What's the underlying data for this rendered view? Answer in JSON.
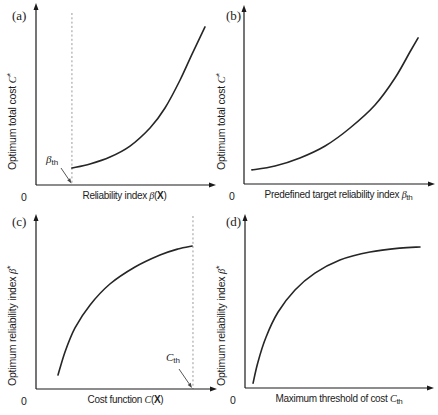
{
  "figure": {
    "colors": {
      "background": "#ffffff",
      "axis": "#1a1a1a",
      "curve": "#262626",
      "dashed": "#9a9a9a",
      "text": "#1c1c1c",
      "annotation_arrow": "#444444"
    }
  },
  "panels": [
    {
      "tag": "(a)",
      "ylabel": {
        "prefix": "Optimum total cost ",
        "var": "C",
        "sup": "*"
      },
      "xlabel": {
        "prefix": "Reliability index ",
        "var": "β",
        "open": "(",
        "bold": "X",
        "close": ")"
      },
      "origin": "0",
      "annotation": {
        "var": "β",
        "sub": "th"
      }
    },
    {
      "tag": "(b)",
      "ylabel": {
        "prefix": "Optimum total cost ",
        "var": "C",
        "sup": "*"
      },
      "xlabel": {
        "prefix": "Predefined target reliability index ",
        "var": "β",
        "sub": "th"
      },
      "origin": "0"
    },
    {
      "tag": "(c)",
      "ylabel": {
        "prefix": "Optimum reliability index ",
        "var": "β",
        "sup": "*"
      },
      "xlabel": {
        "prefix": "Cost function ",
        "var": "C",
        "open": "(",
        "bold": "X",
        "close": ")"
      },
      "origin": "0",
      "annotation": {
        "var": "C",
        "sub": "th"
      }
    },
    {
      "tag": "(d)",
      "ylabel": {
        "prefix": "Optimum reliability index ",
        "var": "β",
        "sup": "*"
      },
      "xlabel": {
        "prefix": "Maximum threshold of cost ",
        "var": "C",
        "sub": "th"
      },
      "origin": "0"
    }
  ],
  "chart_data": [
    {
      "type": "line",
      "panel": "(a)",
      "title": "",
      "xlabel": "Reliability index β(X)",
      "ylabel": "Optimum total cost C*",
      "axes": "qualitative sketch, only origin labeled 0, arrowed axes, no ticks",
      "shape": "convex increasing (exponential-like), starts at vertical dashed threshold line",
      "points": {
        "x": [
          0.203,
          0.305,
          0.418,
          0.531,
          0.644,
          0.729,
          0.814,
          0.887,
          0.955
        ],
        "y": [
          0.096,
          0.119,
          0.158,
          0.22,
          0.322,
          0.435,
          0.593,
          0.751,
          0.893
        ]
      },
      "threshold": {
        "axis": "x",
        "frac": 0.203,
        "label": "βth",
        "style": "vertical dashed line, arrow annotation at axis"
      }
    },
    {
      "type": "line",
      "panel": "(b)",
      "title": "",
      "xlabel": "Predefined target reliability index βth",
      "ylabel": "Optimum total cost C*",
      "axes": "qualitative sketch, only origin labeled 0, arrowed axes, no ticks",
      "shape": "convex increasing",
      "points": {
        "x": [
          0.042,
          0.164,
          0.296,
          0.429,
          0.561,
          0.693,
          0.799,
          0.878,
          0.921
        ],
        "y": [
          0.08,
          0.102,
          0.148,
          0.216,
          0.318,
          0.449,
          0.602,
          0.75,
          0.83
        ]
      }
    },
    {
      "type": "line",
      "panel": "(c)",
      "title": "",
      "xlabel": "Cost function C(X)",
      "ylabel": "Optimum reliability index β*",
      "axes": "qualitative sketch, only origin labeled 0, arrowed axes, no ticks",
      "shape": "concave increasing (saturating), ends at vertical dashed threshold line",
      "points": {
        "x": [
          0.123,
          0.162,
          0.218,
          0.302,
          0.413,
          0.553,
          0.693,
          0.793,
          0.872
        ],
        "y": [
          0.079,
          0.209,
          0.345,
          0.475,
          0.593,
          0.689,
          0.757,
          0.791,
          0.808
        ]
      },
      "threshold": {
        "axis": "x",
        "frac": 0.877,
        "label": "Cth",
        "style": "vertical dashed line, arrow annotation at axis"
      }
    },
    {
      "type": "line",
      "panel": "(d)",
      "title": "",
      "xlabel": "Maximum threshold of cost Cth",
      "ylabel": "Optimum reliability index β*",
      "axes": "qualitative sketch, only origin labeled 0, arrowed axes, no ticks",
      "shape": "concave increasing (saturating)",
      "points": {
        "x": [
          0.043,
          0.069,
          0.112,
          0.176,
          0.266,
          0.372,
          0.505,
          0.665,
          0.824,
          0.931
        ],
        "y": [
          0.028,
          0.148,
          0.29,
          0.432,
          0.557,
          0.653,
          0.727,
          0.773,
          0.795,
          0.801
        ]
      }
    }
  ]
}
